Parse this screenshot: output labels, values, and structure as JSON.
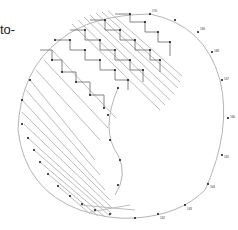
{
  "title_fragment": "to-",
  "puzzle": {
    "type": "dot-to-dot",
    "line_color": "#b0b0b0",
    "dot_color": "#111111",
    "outer_arc_labels": [
      "170",
      "169",
      "168",
      "167",
      "166",
      "165",
      "164",
      "163",
      "162"
    ],
    "visible_labels_sample": [
      "1",
      "2",
      "3",
      "4",
      "5",
      "6",
      "7",
      "8",
      "9",
      "10",
      "50",
      "51",
      "52",
      "53",
      "54",
      "55",
      "56",
      "57",
      "58",
      "59",
      "60",
      "110",
      "111",
      "112",
      "113",
      "114",
      "115",
      "116",
      "117",
      "118",
      "119",
      "120",
      "121",
      "122",
      "123",
      "124",
      "125",
      "126",
      "127",
      "128",
      "129",
      "130",
      "131",
      "132",
      "133",
      "134",
      "135",
      "136",
      "137",
      "138",
      "139",
      "140",
      "141",
      "142",
      "143",
      "144",
      "145",
      "146",
      "147",
      "148",
      "149",
      "150",
      "151",
      "152",
      "153",
      "154",
      "155",
      "156",
      "157",
      "158",
      "159",
      "160",
      "161",
      "162",
      "163",
      "164",
      "165",
      "166",
      "167",
      "168",
      "169",
      "170"
    ]
  }
}
